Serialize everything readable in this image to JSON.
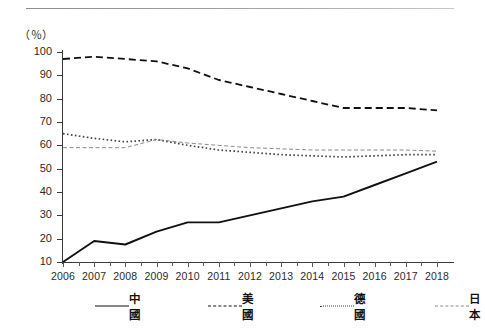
{
  "figure": {
    "unit_label": "（％）",
    "axis": {
      "y_ticks": [
        100,
        90,
        80,
        70,
        60,
        50,
        40,
        30,
        20,
        10
      ],
      "y_min": 10,
      "y_max": 100
    }
  },
  "legend": {
    "items": [
      {
        "label": "中國",
        "style": "solid",
        "swatch": "legend-line-solid"
      },
      {
        "label": "美國",
        "style": "dashed",
        "swatch": "legend-line-dashed"
      },
      {
        "label": "德國",
        "style": "dotted",
        "swatch": "legend-line-dotted"
      },
      {
        "label": "日本",
        "style": "thin-dash",
        "swatch": "legend-line-thin"
      }
    ]
  },
  "chart_data": {
    "type": "line",
    "title": "",
    "subtitle": "",
    "xlabel": "",
    "ylabel": "（％）",
    "grid": false,
    "legend_position": "bottom",
    "xlim": [
      2006,
      2018
    ],
    "ylim": [
      10,
      100
    ],
    "y_ticks": [
      10,
      20,
      30,
      40,
      50,
      60,
      70,
      80,
      90,
      100
    ],
    "categories": [
      "2006",
      "2007",
      "2008",
      "2009",
      "2010",
      "2011",
      "2012",
      "2013",
      "2014",
      "2015",
      "2016",
      "2017",
      "2018"
    ],
    "x": [
      2006,
      2007,
      2008,
      2009,
      2010,
      2011,
      2012,
      2013,
      2014,
      2015,
      2016,
      2017,
      2018
    ],
    "series": [
      {
        "name": "中國",
        "style": "solid",
        "color": "#111111",
        "values": [
          10,
          19,
          17.5,
          23,
          27,
          27,
          30,
          33,
          36,
          38,
          43,
          48,
          53
        ]
      },
      {
        "name": "美國",
        "style": "dashed",
        "color": "#111111",
        "values": [
          97,
          98,
          97,
          96,
          93,
          88,
          85,
          82,
          79,
          76,
          76,
          76,
          75
        ]
      },
      {
        "name": "德國",
        "style": "dotted",
        "color": "#444444",
        "values": [
          65,
          63,
          61.5,
          62.5,
          60,
          58,
          57,
          56,
          55.5,
          55,
          55.5,
          56,
          56
        ]
      },
      {
        "name": "日本",
        "style": "thin-dash",
        "color": "#8a8a8a",
        "values": [
          59,
          59,
          59,
          62.5,
          61,
          60,
          59,
          58.5,
          58,
          58,
          58,
          58,
          57.5
        ]
      }
    ]
  }
}
